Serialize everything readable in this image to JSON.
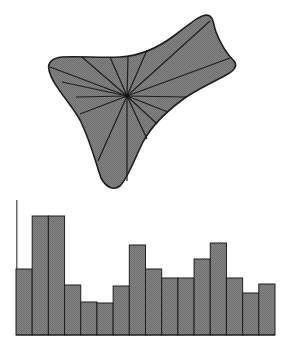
{
  "chart_data": [
    {
      "type": "polar-blob",
      "title": "",
      "description": "Irregular star-shaped closed curve with radial spokes from a central point",
      "center": [
        127,
        96
      ],
      "spoke_count": 16,
      "fill": "#7b7b7b",
      "stroke": "#1e1e1e"
    },
    {
      "type": "bar",
      "title": "",
      "xlabel": "",
      "ylabel": "",
      "categories": [
        "1",
        "2",
        "3",
        "4",
        "5",
        "6",
        "7",
        "8",
        "9",
        "10",
        "11",
        "12",
        "13",
        "14",
        "15",
        "16"
      ],
      "values": [
        66,
        119,
        119,
        50,
        33,
        32,
        49,
        90,
        66,
        57,
        57,
        76,
        92,
        57,
        42,
        51
      ],
      "ylim": [
        0,
        135
      ],
      "grid": false,
      "legend": null,
      "fill": "#7b7b7b",
      "stroke": "#1e1e1e"
    }
  ],
  "colors": {
    "fill": "#7b7b7b",
    "stroke": "#1e1e1e",
    "background": "#ffffff"
  }
}
